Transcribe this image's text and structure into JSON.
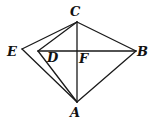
{
  "diagram": {
    "type": "geometric-figure",
    "points": {
      "A": {
        "label": "A",
        "x": 77,
        "y": 102,
        "lx": 70,
        "ly": 117
      },
      "B": {
        "label": "B",
        "x": 136,
        "y": 51,
        "lx": 137,
        "ly": 56
      },
      "C": {
        "label": "C",
        "x": 77,
        "y": 22,
        "lx": 70,
        "ly": 16
      },
      "D": {
        "label": "D",
        "x": 38,
        "y": 51,
        "lx": 47,
        "ly": 62
      },
      "E": {
        "label": "E",
        "x": 22,
        "y": 49,
        "lx": 7,
        "ly": 56
      },
      "F": {
        "label": "F",
        "x": 77,
        "y": 51,
        "lx": 79,
        "ly": 63
      }
    },
    "segments": [
      [
        "C",
        "A"
      ],
      [
        "C",
        "B"
      ],
      [
        "B",
        "A"
      ],
      [
        "C",
        "E"
      ],
      [
        "E",
        "A"
      ],
      [
        "C",
        "D"
      ],
      [
        "D",
        "A"
      ],
      [
        "D",
        "B"
      ]
    ],
    "labels": {
      "A": "A",
      "B": "B",
      "C": "C",
      "D": "D",
      "E": "E",
      "F": "F"
    }
  }
}
